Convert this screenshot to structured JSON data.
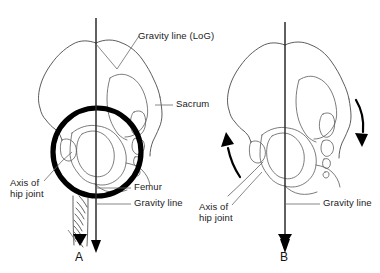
{
  "figure": {
    "background_color": "#ffffff",
    "line_color": "#4a4a4a",
    "accent_color": "#000000",
    "width": 380,
    "height": 273
  },
  "panels": [
    {
      "id": "A",
      "label": "A",
      "description": "Pelvis with gravity line passing through hip joint axis; hip joint circled",
      "labels": [
        {
          "name": "gravity-line-log",
          "text": "Gravity line (LoG)"
        },
        {
          "name": "sacrum",
          "text": "Sacrum"
        },
        {
          "name": "axis-of-hip-joint",
          "line1": "Axis of",
          "line2": "hip joint"
        },
        {
          "name": "femur",
          "text": "Femur"
        },
        {
          "name": "gravity-line",
          "text": "Gravity line"
        }
      ]
    },
    {
      "id": "B",
      "label": "B",
      "description": "Pelvis with gravity line posterior to hip joint axis; curved arrows show pelvic rotation",
      "labels": [
        {
          "name": "axis-of-hip-joint",
          "line1": "Axis of",
          "line2": "hip joint"
        },
        {
          "name": "gravity-line",
          "text": "Gravity line"
        }
      ],
      "arrows": [
        {
          "name": "anterior-rotation-arrow",
          "direction": "up-left"
        },
        {
          "name": "posterior-rotation-arrow",
          "direction": "down-right"
        }
      ]
    }
  ]
}
